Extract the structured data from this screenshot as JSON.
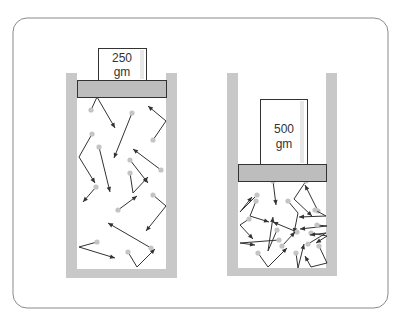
{
  "diagram": {
    "colors": {
      "wall": "#c8c8c8",
      "piston": "#bdbdbd",
      "outline": "#333333",
      "molecule": "#c4c4c4",
      "frame": "#8a8a8a"
    },
    "cylinders": [
      {
        "id": "left",
        "weight_value": "250",
        "weight_unit": "gm",
        "molecule_count": 13
      },
      {
        "id": "right",
        "weight_value": "500",
        "weight_unit": "gm",
        "molecule_count": 18
      }
    ]
  }
}
